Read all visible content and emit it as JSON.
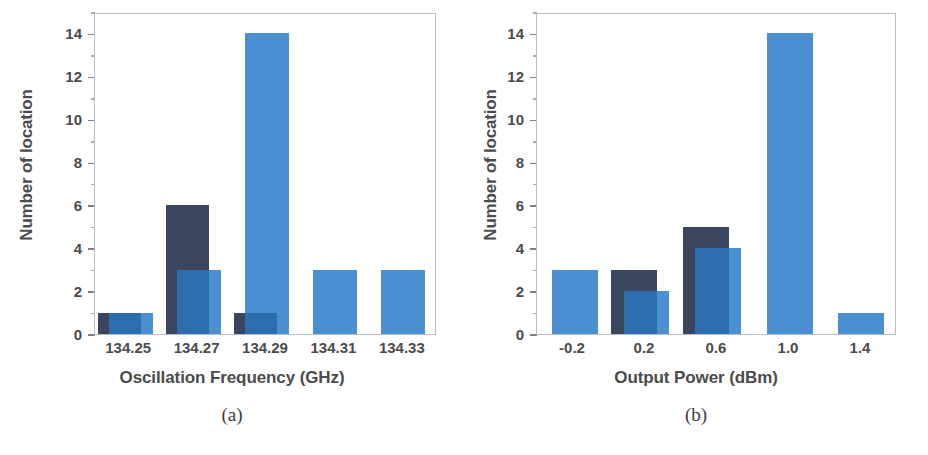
{
  "figure": {
    "panels": [
      "a",
      "b"
    ],
    "colors": {
      "dark_series": "#3a4560",
      "light_series": "#4a90d0",
      "overlap": "#2e6eae",
      "axis": "#b9bcc2",
      "text": "#4b4b4b",
      "background": "#ffffff"
    }
  },
  "panel_a": {
    "subcaption": "(a)",
    "ylabel": "Number of location",
    "xlabel": "Oscillation Frequency (GHz)",
    "xticklabels": [
      "134.25",
      "134.27",
      "134.29",
      "134.31",
      "134.33"
    ],
    "yticklabels": [
      "0",
      "2",
      "4",
      "6",
      "8",
      "10",
      "12",
      "14"
    ]
  },
  "panel_b": {
    "subcaption": "(b)",
    "ylabel": "Number of location",
    "xlabel": "Output Power (dBm)",
    "xticklabels": [
      "-0.2",
      "0.2",
      "0.6",
      "1.0",
      "1.4"
    ],
    "yticklabels": [
      "0",
      "2",
      "4",
      "6",
      "8",
      "10",
      "12",
      "14"
    ]
  },
  "chart_data": [
    {
      "type": "bar",
      "panel": "(a)",
      "title": "",
      "xlabel": "Oscillation Frequency (GHz)",
      "ylabel": "Number of location",
      "categories": [
        "134.25",
        "134.27",
        "134.29",
        "134.31",
        "134.33"
      ],
      "series": [
        {
          "name": "dark",
          "color": "#3a4560",
          "values": [
            1,
            6,
            1,
            0,
            0
          ]
        },
        {
          "name": "light",
          "color": "#4a90d0",
          "values": [
            1,
            3,
            14,
            3,
            3
          ]
        }
      ],
      "ylim": [
        0,
        15
      ],
      "ytick_major_step": 2,
      "ytick_minor_step": 1,
      "grid": false,
      "legend": "none",
      "overlap_style": "light bars drawn offset to the right, overlapping dark bars"
    },
    {
      "type": "bar",
      "panel": "(b)",
      "title": "",
      "xlabel": "Output Power (dBm)",
      "ylabel": "Number of location",
      "categories": [
        "-0.2",
        "0.2",
        "0.6",
        "1.0",
        "1.4"
      ],
      "series": [
        {
          "name": "dark",
          "color": "#3a4560",
          "values": [
            0,
            3,
            5,
            0,
            0
          ]
        },
        {
          "name": "light",
          "color": "#4a90d0",
          "values": [
            3,
            2,
            4,
            14,
            1
          ]
        }
      ],
      "ylim": [
        0,
        15
      ],
      "ytick_major_step": 2,
      "ytick_minor_step": 1,
      "grid": false,
      "legend": "none",
      "overlap_style": "light bars drawn offset to the right, overlapping dark bars"
    }
  ]
}
